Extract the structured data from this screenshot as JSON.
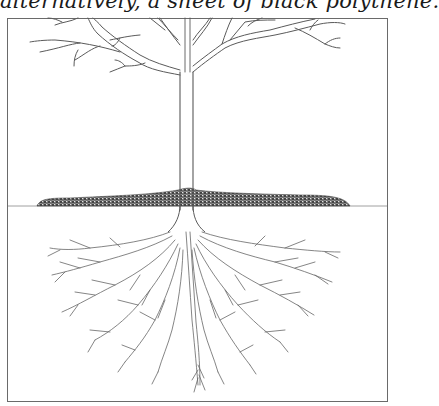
{
  "caption": {
    "text": "alternatively, a sheet of black polythene."
  },
  "illustration": {
    "subject": "tree with mulch ring and spreading root system",
    "frame": {
      "x": 7,
      "y": 18,
      "width": 381,
      "height": 384
    },
    "ground_line_y": 206,
    "colors": {
      "line": "#555555",
      "mulch": "#3a3a3a",
      "background": "#ffffff",
      "frame": "#6a6a6a"
    },
    "labels": {
      "trunk": "trunk",
      "mulch": "mulch",
      "roots": "roots",
      "ground": "ground-line"
    }
  }
}
